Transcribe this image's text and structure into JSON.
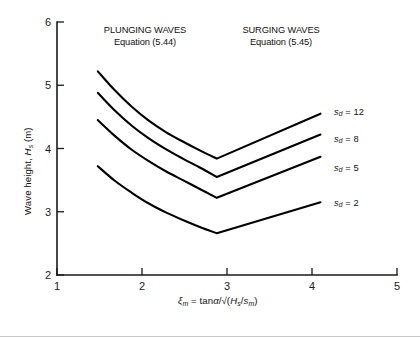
{
  "figure": {
    "background_color": "#ffffff",
    "line_color": "#000000",
    "axis_color": "#1a1a1a"
  },
  "annotations": {
    "plunging": {
      "line1": "PLUNGING WAVES",
      "line2": "Equation (5.44)"
    },
    "surging": {
      "line1": "SURGING WAVES",
      "line2": "Equation (5.45)"
    }
  },
  "axis_titles": {
    "y_prefix": "Wave height, ",
    "y_symbol": "H",
    "y_symbol_sub": "s",
    "y_suffix": " (m)",
    "x_symbol": "ξ",
    "x_symbol_sub": "m",
    "x_mid": " = tan",
    "x_alpha": "α",
    "x_slash": "/",
    "x_radical": "√",
    "x_open": "(",
    "x_num": "H",
    "x_num_sub": "s",
    "x_div": "/",
    "x_den": "s",
    "x_den_sub": "m",
    "x_close": ")"
  },
  "ticks": {
    "x": [
      "1",
      "2",
      "3",
      "4",
      "5"
    ],
    "y": [
      "2",
      "3",
      "4",
      "5",
      "6"
    ]
  },
  "series_labels": [
    {
      "symbol": "s",
      "sub": "d",
      "eq": " = ",
      "value": "12"
    },
    {
      "symbol": "s",
      "sub": "d",
      "eq": " = ",
      "value": "8"
    },
    {
      "symbol": "s",
      "sub": "d",
      "eq": " = ",
      "value": "5"
    },
    {
      "symbol": "s",
      "sub": "d",
      "eq": " = ",
      "value": "2"
    }
  ],
  "chart_data": {
    "type": "line",
    "title": "",
    "xlabel": "ξm = tanα/√(Hs/sm)",
    "ylabel": "Wave height, Hs (m)",
    "xlim": [
      1,
      5
    ],
    "ylim": [
      2,
      6
    ],
    "xticks": [
      1,
      2,
      3,
      4,
      5
    ],
    "yticks": [
      2,
      3,
      4,
      5,
      6
    ],
    "grid": false,
    "legend": "inline-right",
    "annotations": [
      {
        "text": "PLUNGING WAVES Equation (5.44)",
        "x": 1.95,
        "y": 5.75
      },
      {
        "text": "SURGING WAVES Equation (5.45)",
        "x": 3.35,
        "y": 5.75
      }
    ],
    "series": [
      {
        "name": "sd = 12",
        "x": [
          1.48,
          1.68,
          1.88,
          2.08,
          2.28,
          2.48,
          2.68,
          2.88,
          3.18,
          3.48,
          3.78,
          4.1
        ],
        "y": [
          5.22,
          4.92,
          4.66,
          4.44,
          4.26,
          4.11,
          3.97,
          3.84,
          4.02,
          4.2,
          4.37,
          4.55
        ]
      },
      {
        "name": "sd = 8",
        "x": [
          1.48,
          1.68,
          1.88,
          2.08,
          2.28,
          2.48,
          2.68,
          2.88,
          3.18,
          3.48,
          3.78,
          4.1
        ],
        "y": [
          4.88,
          4.6,
          4.36,
          4.16,
          3.99,
          3.84,
          3.7,
          3.55,
          3.72,
          3.89,
          4.06,
          4.22
        ]
      },
      {
        "name": "sd = 5",
        "x": [
          1.48,
          1.68,
          1.88,
          2.08,
          2.28,
          2.48,
          2.68,
          2.88,
          3.18,
          3.48,
          3.78,
          4.1
        ],
        "y": [
          4.45,
          4.2,
          3.98,
          3.8,
          3.64,
          3.5,
          3.36,
          3.22,
          3.38,
          3.55,
          3.71,
          3.87
        ]
      },
      {
        "name": "sd = 2",
        "x": [
          1.48,
          1.68,
          1.88,
          2.08,
          2.28,
          2.48,
          2.68,
          2.88,
          3.18,
          3.48,
          3.78,
          4.1
        ],
        "y": [
          3.72,
          3.49,
          3.3,
          3.13,
          2.99,
          2.87,
          2.76,
          2.66,
          2.78,
          2.91,
          3.03,
          3.15
        ]
      }
    ]
  }
}
